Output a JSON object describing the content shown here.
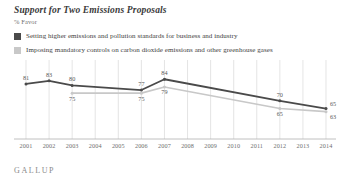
{
  "header": {
    "title": "Support for Two Emissions Proposals",
    "subtitle": "% Favor"
  },
  "brand": "GALLUP",
  "colors": {
    "series_dark": "#4a4a4a",
    "series_light": "#c8c8c8",
    "gridline": "#d8d8d8",
    "axis": "#b0b0b0",
    "label_text": "#5a5a5a",
    "tick_text": "#6f6f6f"
  },
  "legend": {
    "position": "top",
    "items": [
      {
        "label": "Setting higher emissions and pollution standards for business and industry",
        "color": "#4a4a4a"
      },
      {
        "label": "Imposing mandatory controls on carbon dioxide emissions and other greenhouse gases",
        "color": "#c8c8c8"
      }
    ]
  },
  "chart_data": {
    "type": "line",
    "title": "Support for Two Emissions Proposals",
    "subtitle": "% Favor",
    "xlabel": "",
    "ylabel": "% Favor",
    "ylim": [
      55,
      90
    ],
    "grid": "vertical",
    "categories": [
      "2001",
      "2002",
      "2003",
      "2004",
      "2005",
      "2006",
      "2007",
      "2008",
      "2009",
      "2010",
      "2011",
      "2012",
      "2013",
      "2014"
    ],
    "series": [
      {
        "name": "Setting higher emissions and pollution standards for business and industry",
        "color": "#4a4a4a",
        "points": [
          {
            "x": "2001",
            "y": 81,
            "label": "81"
          },
          {
            "x": "2002",
            "y": 83,
            "label": "83"
          },
          {
            "x": "2003",
            "y": 80,
            "label": "80"
          },
          {
            "x": "2006",
            "y": 77,
            "label": "77"
          },
          {
            "x": "2007",
            "y": 84,
            "label": "84"
          },
          {
            "x": "2012",
            "y": 70,
            "label": "70"
          },
          {
            "x": "2014",
            "y": 65,
            "label": "65"
          }
        ]
      },
      {
        "name": "Imposing mandatory controls on carbon dioxide emissions and other greenhouse gases",
        "color": "#c8c8c8",
        "points": [
          {
            "x": "2003",
            "y": 75,
            "label": "75"
          },
          {
            "x": "2006",
            "y": 75,
            "label": "75"
          },
          {
            "x": "2007",
            "y": 79,
            "label": "79"
          },
          {
            "x": "2012",
            "y": 65,
            "label": "65"
          },
          {
            "x": "2014",
            "y": 63,
            "label": "63"
          }
        ]
      }
    ]
  },
  "xaxis": {
    "ticks": [
      "2001",
      "2002",
      "2003",
      "2004",
      "2005",
      "2006",
      "2007",
      "2008",
      "2009",
      "2010",
      "2011",
      "2012",
      "2013",
      "2014"
    ]
  }
}
